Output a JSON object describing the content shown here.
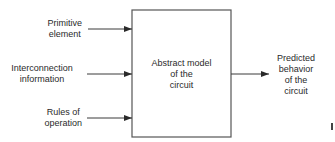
{
  "diagram": {
    "type": "block-diagram",
    "inputs": [
      {
        "lines": [
          "Primitive",
          "element"
        ]
      },
      {
        "lines": [
          "Interconnection",
          "information"
        ]
      },
      {
        "lines": [
          "Rules of",
          "operation"
        ]
      }
    ],
    "block": {
      "lines": [
        "Abstract model",
        "of the",
        "circuit"
      ]
    },
    "output": {
      "lines": [
        "Predicted",
        "behavior",
        "of the",
        "circuit"
      ]
    },
    "edges": [
      {
        "from": "Primitive element",
        "to": "Abstract model of the circuit"
      },
      {
        "from": "Interconnection information",
        "to": "Abstract model of the circuit"
      },
      {
        "from": "Rules of operation",
        "to": "Abstract model of the circuit"
      },
      {
        "from": "Abstract model of the circuit",
        "to": "Predicted behavior of the circuit"
      }
    ],
    "colors": {
      "line": "#3a3a3a",
      "text": "#2a2a2a",
      "background": "#ffffff"
    }
  }
}
